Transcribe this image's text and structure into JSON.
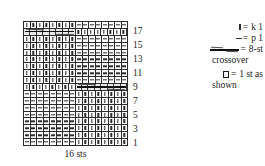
{
  "chart_data": {
    "type": "table",
    "title": "16 sts",
    "columns": 16,
    "rows": 18,
    "row_labels": [
      "17",
      "15",
      "13",
      "11",
      "9",
      "7",
      "5",
      "3",
      "1"
    ],
    "row_label_note": "odd rows numbered, read bottom to top",
    "symbols": {
      "knit": "|",
      "purl": "-",
      "crossover": "8-st crossover"
    },
    "grid": [
      {
        "row": 18,
        "cells": [
          "knit",
          "knit",
          "knit",
          "knit",
          "knit",
          "knit",
          "knit",
          "knit",
          "purl",
          "purl",
          "purl",
          "purl",
          "purl",
          "purl",
          "purl",
          "purl"
        ]
      },
      {
        "row": 17,
        "cells": [
          "cross",
          "cross",
          "cross",
          "cross",
          "cross",
          "cross",
          "cross",
          "cross",
          "knit",
          "knit",
          "knit",
          "knit",
          "knit",
          "knit",
          "knit",
          "knit"
        ]
      },
      {
        "row": 16,
        "cells": [
          "knit",
          "knit",
          "knit",
          "knit",
          "knit",
          "knit",
          "knit",
          "knit",
          "purl",
          "purl",
          "purl",
          "purl",
          "purl",
          "purl",
          "purl",
          "purl"
        ]
      },
      {
        "row": 15,
        "cells": [
          "knit",
          "knit",
          "knit",
          "knit",
          "knit",
          "knit",
          "knit",
          "knit",
          "purl",
          "purl",
          "purl",
          "purl",
          "purl",
          "purl",
          "purl",
          "purl"
        ]
      },
      {
        "row": 14,
        "cells": [
          "knit",
          "knit",
          "knit",
          "knit",
          "knit",
          "knit",
          "knit",
          "knit",
          "purl",
          "purl",
          "purl",
          "purl",
          "purl",
          "purl",
          "purl",
          "purl"
        ]
      },
      {
        "row": 13,
        "cells": [
          "knit",
          "knit",
          "knit",
          "knit",
          "knit",
          "knit",
          "knit",
          "knit",
          "purl",
          "purl",
          "purl",
          "purl",
          "purl",
          "purl",
          "purl",
          "purl"
        ]
      },
      {
        "row": 12,
        "cells": [
          "knit",
          "knit",
          "knit",
          "knit",
          "knit",
          "knit",
          "knit",
          "knit",
          "purl",
          "purl",
          "purl",
          "purl",
          "purl",
          "purl",
          "purl",
          "purl"
        ]
      },
      {
        "row": 11,
        "cells": [
          "knit",
          "knit",
          "knit",
          "knit",
          "knit",
          "knit",
          "knit",
          "knit",
          "purl",
          "purl",
          "purl",
          "purl",
          "purl",
          "purl",
          "purl",
          "purl"
        ]
      },
      {
        "row": 10,
        "cells": [
          "knit",
          "knit",
          "knit",
          "knit",
          "knit",
          "knit",
          "knit",
          "knit",
          "purl",
          "purl",
          "purl",
          "purl",
          "purl",
          "purl",
          "purl",
          "purl"
        ]
      },
      {
        "row": 9,
        "cells": [
          "knit",
          "knit",
          "knit",
          "knit",
          "knit",
          "knit",
          "knit",
          "knit",
          "cross",
          "cross",
          "cross",
          "cross",
          "cross",
          "cross",
          "cross",
          "cross"
        ]
      },
      {
        "row": 8,
        "cells": [
          "purl",
          "purl",
          "purl",
          "purl",
          "purl",
          "purl",
          "purl",
          "purl",
          "knit",
          "knit",
          "knit",
          "knit",
          "knit",
          "knit",
          "knit",
          "knit"
        ]
      },
      {
        "row": 7,
        "cells": [
          "purl",
          "purl",
          "purl",
          "purl",
          "purl",
          "purl",
          "purl",
          "purl",
          "knit",
          "knit",
          "knit",
          "knit",
          "knit",
          "knit",
          "knit",
          "knit"
        ]
      },
      {
        "row": 6,
        "cells": [
          "purl",
          "purl",
          "purl",
          "purl",
          "purl",
          "purl",
          "purl",
          "purl",
          "knit",
          "knit",
          "knit",
          "knit",
          "knit",
          "knit",
          "knit",
          "knit"
        ]
      },
      {
        "row": 5,
        "cells": [
          "purl",
          "purl",
          "purl",
          "purl",
          "purl",
          "purl",
          "purl",
          "purl",
          "knit",
          "knit",
          "knit",
          "knit",
          "knit",
          "knit",
          "knit",
          "knit"
        ]
      },
      {
        "row": 4,
        "cells": [
          "purl",
          "purl",
          "purl",
          "purl",
          "purl",
          "purl",
          "purl",
          "purl",
          "knit",
          "knit",
          "knit",
          "knit",
          "knit",
          "knit",
          "knit",
          "knit"
        ]
      },
      {
        "row": 3,
        "cells": [
          "purl",
          "purl",
          "purl",
          "purl",
          "purl",
          "purl",
          "purl",
          "purl",
          "knit",
          "knit",
          "knit",
          "knit",
          "knit",
          "knit",
          "knit",
          "knit"
        ]
      },
      {
        "row": 2,
        "cells": [
          "purl",
          "purl",
          "purl",
          "purl",
          "purl",
          "purl",
          "purl",
          "purl",
          "knit",
          "knit",
          "knit",
          "knit",
          "knit",
          "knit",
          "knit",
          "knit"
        ]
      },
      {
        "row": 1,
        "cells": [
          "purl",
          "purl",
          "purl",
          "purl",
          "purl",
          "purl",
          "purl",
          "purl",
          "knit",
          "knit",
          "knit",
          "knit",
          "knit",
          "knit",
          "knit",
          "knit"
        ]
      }
    ]
  },
  "chart": {
    "caption": "16 sts",
    "row_numbers": [
      "17",
      "15",
      "13",
      "11",
      "9",
      "7",
      "5",
      "3",
      "1"
    ]
  },
  "legend": {
    "equals": "=",
    "items": [
      {
        "symbol": "knit-stitch-icon",
        "text": "k 1"
      },
      {
        "symbol": "purl-stitch-icon",
        "text": "p 1"
      },
      {
        "symbol": "crossover-icon",
        "text": "8-st"
      },
      {
        "symbol": "none",
        "text": "crossover"
      },
      {
        "symbol": "box-icon",
        "text": "1 st as"
      },
      {
        "symbol": "none",
        "text": "shown"
      }
    ]
  }
}
